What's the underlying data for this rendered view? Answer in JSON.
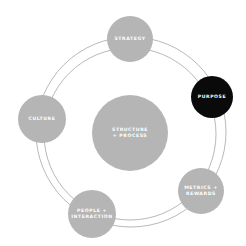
{
  "diagram": {
    "title": "",
    "ring": {
      "stroke_color": "#9a9a9a",
      "inner_radius": 86,
      "outer_radius": 95,
      "center": [
        131,
        132
      ]
    },
    "center_node": {
      "lines": [
        "STRUCTURE",
        "+ PROCESS"
      ],
      "color": "#b5b5b5",
      "cx": 130,
      "cy": 133,
      "r": 38
    },
    "nodes": [
      {
        "id": "strategy",
        "lines": [
          "STRATEGY"
        ],
        "color": "#b5b5b5",
        "cx": 130,
        "cy": 39,
        "r": 23
      },
      {
        "id": "purpose",
        "lines": [
          "PURPOSE"
        ],
        "color": "#0a0a0a",
        "cx": 212,
        "cy": 97,
        "r": 21
      },
      {
        "id": "metrics-rewards",
        "lines": [
          "METRICS +",
          "REWARDS"
        ],
        "color": "#b5b5b5",
        "cx": 201,
        "cy": 191,
        "r": 23
      },
      {
        "id": "people-interaction",
        "lines": [
          "PEOPLE +",
          "INTERACTION"
        ],
        "color": "#b5b5b5",
        "cx": 92,
        "cy": 214,
        "r": 24
      },
      {
        "id": "culture",
        "lines": [
          "CULTURE"
        ],
        "color": "#b5b5b5",
        "cx": 42,
        "cy": 119,
        "r": 24
      }
    ]
  }
}
